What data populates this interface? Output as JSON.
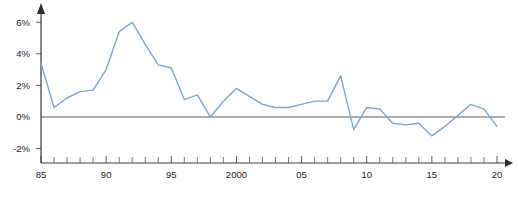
{
  "chart_data": {
    "type": "line",
    "title": "",
    "subtitle": "",
    "xlabel": "",
    "ylabel": "",
    "xlim": [
      1985,
      2020
    ],
    "ylim": [
      -2.6,
      6.9
    ],
    "grid": false,
    "legend": null,
    "zero_baseline": 0,
    "line_color": "#7ba7d4",
    "axis_color": "#3a3a3a",
    "y_ticks": [
      {
        "value": 6,
        "label": "6%"
      },
      {
        "value": 4,
        "label": "4%"
      },
      {
        "value": 2,
        "label": "2%"
      },
      {
        "value": 0,
        "label": "0%"
      },
      {
        "value": -2,
        "label": "-2%"
      }
    ],
    "x_ticks_major": [
      {
        "value": 1985,
        "label": "85"
      },
      {
        "value": 1990,
        "label": "90"
      },
      {
        "value": 1995,
        "label": "95"
      },
      {
        "value": 2000,
        "label": "2000"
      },
      {
        "value": 2005,
        "label": "05"
      },
      {
        "value": 2010,
        "label": "10"
      },
      {
        "value": 2015,
        "label": "15"
      },
      {
        "value": 2020,
        "label": "20"
      }
    ],
    "x_ticks_minor": [
      1986,
      1987,
      1988,
      1989,
      1991,
      1992,
      1993,
      1994,
      1996,
      1997,
      1998,
      1999,
      2001,
      2002,
      2003,
      2004,
      2006,
      2007,
      2008,
      2009,
      2011,
      2012,
      2013,
      2014,
      2016,
      2017,
      2018,
      2019
    ],
    "x": [
      1985,
      1986,
      1987,
      1988,
      1989,
      1990,
      1991,
      1992,
      1993,
      1994,
      1995,
      1996,
      1997,
      1998,
      1999,
      2000,
      2001,
      2002,
      2003,
      2004,
      2005,
      2006,
      2007,
      2008,
      2009,
      2010,
      2011,
      2012,
      2013,
      2014,
      2015,
      2016,
      2017,
      2018,
      2019,
      2020
    ],
    "values": [
      3.4,
      0.6,
      1.2,
      1.6,
      1.7,
      3.0,
      5.4,
      6.0,
      4.6,
      3.3,
      3.1,
      1.1,
      1.4,
      0.0,
      1.0,
      1.8,
      1.3,
      0.8,
      0.6,
      0.6,
      0.8,
      1.0,
      1.0,
      2.6,
      -0.8,
      0.6,
      0.5,
      -0.4,
      -0.5,
      -0.4,
      -1.2,
      -0.6,
      0.1,
      0.8,
      0.5,
      -0.6
    ]
  }
}
